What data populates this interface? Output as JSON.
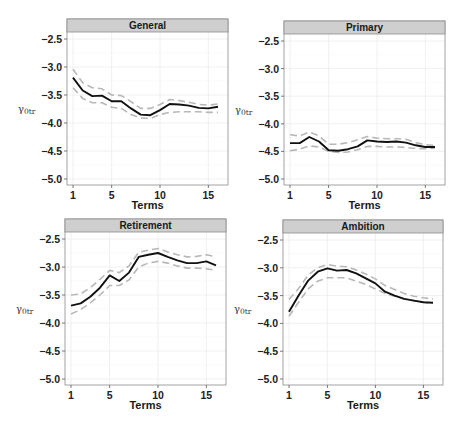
{
  "chart_data": [
    {
      "type": "line",
      "title": "General",
      "xlabel": "Terms",
      "ylabel": "γ0tr",
      "xlim": [
        1,
        16
      ],
      "ylim": [
        -5.1,
        -2.35
      ],
      "xticks": [
        1,
        5,
        10,
        15
      ],
      "yticks": [
        -2.5,
        -3.0,
        -3.5,
        -4.0,
        -4.5,
        -5.0
      ],
      "ytick_labels": [
        "-2.5",
        "-3.0",
        "-3.5",
        "-4.0",
        "-4.5",
        "-5.0"
      ],
      "grid": true,
      "x": [
        1,
        2,
        3,
        4,
        5,
        6,
        7,
        8,
        9,
        10,
        11,
        12,
        13,
        14,
        15,
        16
      ],
      "series": [
        {
          "name": "estimate",
          "style": "solid",
          "color": "#111111",
          "values": [
            -3.19,
            -3.42,
            -3.52,
            -3.51,
            -3.61,
            -3.61,
            -3.74,
            -3.85,
            -3.86,
            -3.77,
            -3.66,
            -3.67,
            -3.69,
            -3.73,
            -3.74,
            -3.71
          ]
        },
        {
          "name": "upper",
          "style": "dashed",
          "color": "#b8b8b8",
          "values": [
            -3.04,
            -3.28,
            -3.37,
            -3.39,
            -3.5,
            -3.51,
            -3.62,
            -3.74,
            -3.74,
            -3.67,
            -3.58,
            -3.6,
            -3.63,
            -3.67,
            -3.68,
            -3.66
          ]
        },
        {
          "name": "lower",
          "style": "dashed",
          "color": "#b8b8b8",
          "values": [
            -3.37,
            -3.56,
            -3.64,
            -3.64,
            -3.72,
            -3.74,
            -3.85,
            -3.91,
            -3.92,
            -3.85,
            -3.81,
            -3.8,
            -3.8,
            -3.8,
            -3.81,
            -3.81
          ]
        }
      ]
    },
    {
      "type": "line",
      "title": "Primary",
      "xlabel": "Terms",
      "ylabel": "γ0tr",
      "xlim": [
        1,
        16
      ],
      "ylim": [
        -5.1,
        -2.35
      ],
      "xticks": [
        1,
        5,
        10,
        15
      ],
      "yticks": [
        -2.5,
        -3.0,
        -3.5,
        -4.0,
        -4.5,
        -5.0
      ],
      "ytick_labels": [
        "-2.5",
        "-3.0",
        "-3.5",
        "-4.0",
        "-4.5",
        "-5.0"
      ],
      "grid": true,
      "x": [
        1,
        2,
        3,
        4,
        5,
        6,
        7,
        8,
        9,
        10,
        11,
        12,
        13,
        14,
        15,
        16
      ],
      "series": [
        {
          "name": "estimate",
          "style": "solid",
          "color": "#111111",
          "values": [
            -4.35,
            -4.35,
            -4.24,
            -4.32,
            -4.48,
            -4.49,
            -4.46,
            -4.41,
            -4.3,
            -4.32,
            -4.33,
            -4.32,
            -4.34,
            -4.39,
            -4.42,
            -4.42
          ]
        },
        {
          "name": "upper",
          "style": "dashed",
          "color": "#b8b8b8",
          "values": [
            -4.2,
            -4.22,
            -4.15,
            -4.22,
            -4.37,
            -4.37,
            -4.34,
            -4.29,
            -4.23,
            -4.26,
            -4.27,
            -4.27,
            -4.28,
            -4.34,
            -4.38,
            -4.39
          ]
        },
        {
          "name": "lower",
          "style": "dashed",
          "color": "#b8b8b8",
          "values": [
            -4.49,
            -4.46,
            -4.4,
            -4.42,
            -4.5,
            -4.52,
            -4.51,
            -4.47,
            -4.41,
            -4.41,
            -4.42,
            -4.42,
            -4.43,
            -4.45,
            -4.45,
            -4.44
          ]
        }
      ]
    },
    {
      "type": "line",
      "title": "Retirement",
      "xlabel": "Terms",
      "ylabel": "γ0tr",
      "xlim": [
        1,
        16
      ],
      "ylim": [
        -5.1,
        -2.35
      ],
      "xticks": [
        1,
        5,
        10,
        15
      ],
      "yticks": [
        -2.5,
        -3.0,
        -3.5,
        -4.0,
        -4.5,
        -5.0
      ],
      "ytick_labels": [
        "-2.5",
        "-3.0",
        "-3.5",
        "-4.0",
        "-4.5",
        "-5.0"
      ],
      "grid": true,
      "x": [
        1,
        2,
        3,
        4,
        5,
        6,
        7,
        8,
        9,
        10,
        11,
        12,
        13,
        14,
        15,
        16
      ],
      "series": [
        {
          "name": "estimate",
          "style": "solid",
          "color": "#111111",
          "values": [
            -3.69,
            -3.65,
            -3.53,
            -3.37,
            -3.15,
            -3.25,
            -3.1,
            -2.82,
            -2.78,
            -2.75,
            -2.82,
            -2.88,
            -2.93,
            -2.93,
            -2.9,
            -2.97
          ]
        },
        {
          "name": "upper",
          "style": "dashed",
          "color": "#b8b8b8",
          "values": [
            -3.5,
            -3.48,
            -3.37,
            -3.22,
            -3.06,
            -3.1,
            -2.98,
            -2.74,
            -2.7,
            -2.67,
            -2.73,
            -2.78,
            -2.82,
            -2.81,
            -2.78,
            -2.82
          ]
        },
        {
          "name": "lower",
          "style": "dashed",
          "color": "#b8b8b8",
          "values": [
            -3.84,
            -3.76,
            -3.64,
            -3.5,
            -3.33,
            -3.33,
            -3.23,
            -3.0,
            -2.93,
            -2.9,
            -2.93,
            -2.98,
            -3.02,
            -3.02,
            -3.03,
            -3.06
          ]
        }
      ]
    },
    {
      "type": "line",
      "title": "Ambition",
      "xlabel": "Terms",
      "ylabel": "γ0tr",
      "xlim": [
        1,
        16
      ],
      "ylim": [
        -5.1,
        -2.35
      ],
      "xticks": [
        1,
        5,
        10,
        15
      ],
      "yticks": [
        -2.5,
        -3.0,
        -3.5,
        -4.0,
        -4.5,
        -5.0
      ],
      "ytick_labels": [
        "-2.5",
        "-3.0",
        "-3.5",
        "-4.0",
        "-4.5",
        "-5.0"
      ],
      "grid": true,
      "x": [
        1,
        2,
        3,
        4,
        5,
        6,
        7,
        8,
        9,
        10,
        11,
        12,
        13,
        14,
        15,
        16
      ],
      "series": [
        {
          "name": "estimate",
          "style": "solid",
          "color": "#111111",
          "values": [
            -3.79,
            -3.5,
            -3.23,
            -3.07,
            -3.01,
            -3.05,
            -3.04,
            -3.1,
            -3.19,
            -3.28,
            -3.43,
            -3.5,
            -3.56,
            -3.59,
            -3.62,
            -3.63
          ]
        },
        {
          "name": "upper",
          "style": "dashed",
          "color": "#b8b8b8",
          "values": [
            -3.57,
            -3.37,
            -3.13,
            -3.0,
            -2.94,
            -2.97,
            -2.98,
            -3.04,
            -3.11,
            -3.2,
            -3.32,
            -3.39,
            -3.46,
            -3.51,
            -3.54,
            -3.56
          ]
        },
        {
          "name": "lower",
          "style": "dashed",
          "color": "#b8b8b8",
          "values": [
            -3.87,
            -3.62,
            -3.38,
            -3.24,
            -3.18,
            -3.18,
            -3.18,
            -3.24,
            -3.3,
            -3.38,
            -3.46,
            -3.51,
            -3.56,
            -3.59,
            -3.62,
            -3.64
          ]
        }
      ]
    }
  ],
  "panels": [
    {
      "title": "General",
      "ylabel": "γ",
      "ylabel_sub": "0tr",
      "xlabel": "Terms"
    },
    {
      "title": "Primary",
      "ylabel": "γ",
      "ylabel_sub": "0tr",
      "xlabel": "Terms"
    },
    {
      "title": "Retirement",
      "ylabel": "γ",
      "ylabel_sub": "0tr",
      "xlabel": "Terms"
    },
    {
      "title": "Ambition",
      "ylabel": "γ",
      "ylabel_sub": "0tr",
      "xlabel": "Terms"
    }
  ],
  "colors": {
    "estimate_line": "#111111",
    "ci_line": "#b8b8b8",
    "strip_fill": "#cfcfcf",
    "panel_border": "#8c8c8c",
    "grid": "#ececec"
  }
}
